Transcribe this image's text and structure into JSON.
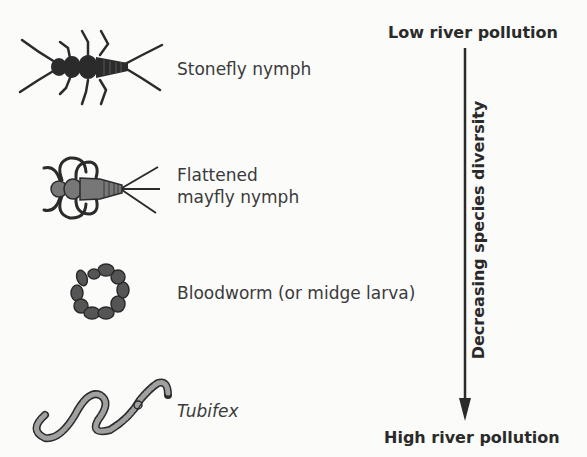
{
  "organisms": [
    {
      "name": "Stonefly nymph",
      "icon": "stonefly-nymph-icon"
    },
    {
      "name_line1": "Flattened",
      "name_line2": "mayfly nymph",
      "icon": "mayfly-nymph-icon"
    },
    {
      "name": "Bloodworm (or midge larva)",
      "icon": "bloodworm-icon"
    },
    {
      "name": "Tubifex",
      "icon": "tubifex-icon"
    }
  ],
  "scale": {
    "top_label": "Low river pollution",
    "bottom_label": "High river pollution",
    "axis_label": "Decreasing species diversity"
  },
  "colors": {
    "dark": "#2b2b2b",
    "mid": "#666666",
    "light": "#a0a0a0",
    "background": "#fbfbfa"
  }
}
